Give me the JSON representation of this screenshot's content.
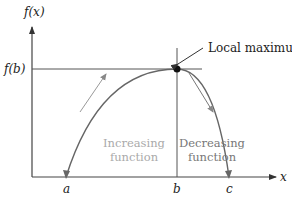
{
  "diagram": {
    "y_axis_label": "f(x)",
    "x_axis_label": "x",
    "fb_label": "f(b)",
    "annotation": "Local maximum",
    "x_ticks": [
      "a",
      "b",
      "c"
    ],
    "increasing_label": [
      "Increasing",
      "function"
    ],
    "decreasing_label": [
      "Decreasing",
      "function"
    ],
    "colors": {
      "axis": "#444444",
      "curve": "#666666",
      "increasing_text": "#aaaaaa",
      "decreasing_text": "#777777",
      "increasing_arrow": "#999999",
      "decreasing_arrow": "#777777",
      "point": "#111111"
    }
  }
}
